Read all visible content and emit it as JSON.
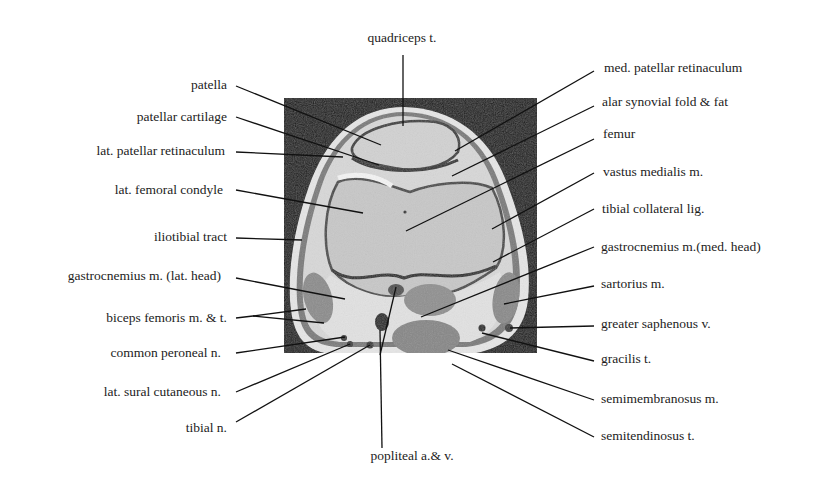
{
  "figure": {
    "type": "axial MRI knee cross-section with anatomical labels",
    "image_region": {
      "x": 284,
      "y": 98,
      "width": 253,
      "height": 255
    },
    "labels_top": [
      {
        "id": "quadriceps-t",
        "text": "quadriceps t."
      }
    ],
    "labels_left": [
      {
        "id": "patella",
        "text": "patella"
      },
      {
        "id": "patellar-cartilage",
        "text": "patellar cartilage"
      },
      {
        "id": "lat-patellar-retinaculum",
        "text": "lat. patellar retinaculum"
      },
      {
        "id": "lat-femoral-condyle",
        "text": "lat. femoral condyle"
      },
      {
        "id": "iliotibial-tract",
        "text": "iliotibial tract"
      },
      {
        "id": "gastrocnemius-lat-head",
        "text": "gastrocnemius m. (lat. head)"
      },
      {
        "id": "biceps-femoris",
        "text": "biceps femoris m. & t."
      },
      {
        "id": "common-peroneal-n",
        "text": "common peroneal n."
      },
      {
        "id": "lat-sural-cutaneous-n",
        "text": "lat. sural cutaneous n."
      },
      {
        "id": "tibial-n",
        "text": "tibial n."
      }
    ],
    "labels_right": [
      {
        "id": "med-patellar-retinaculum",
        "text": "med. patellar retinaculum"
      },
      {
        "id": "alar-synovial-fold",
        "text": "alar synovial fold & fat"
      },
      {
        "id": "femur",
        "text": "femur"
      },
      {
        "id": "vastus-medialis",
        "text": "vastus medialis m."
      },
      {
        "id": "tibial-collateral-lig",
        "text": "tibial collateral lig."
      },
      {
        "id": "gastrocnemius-med-head",
        "text": "gastrocnemius m.(med. head)"
      },
      {
        "id": "sartorius",
        "text": "sartorius m."
      },
      {
        "id": "greater-saphenous-v",
        "text": "greater saphenous v."
      },
      {
        "id": "gracilis-t",
        "text": "gracilis t."
      },
      {
        "id": "semimembranosus",
        "text": "semimembranosus m."
      },
      {
        "id": "semitendinosus-t",
        "text": "semitendinosus t."
      }
    ],
    "labels_bottom": [
      {
        "id": "popliteal-av",
        "text": "popliteal a.& v."
      }
    ],
    "colors": {
      "background": "#ffffff",
      "mri_background": "#1e1e1e",
      "tissue_light": "#c9c9c9",
      "tissue_mid": "#8a8a8a",
      "fat_bright": "#ececec",
      "leader_line": "#111111",
      "text": "#1c1c1c"
    }
  }
}
